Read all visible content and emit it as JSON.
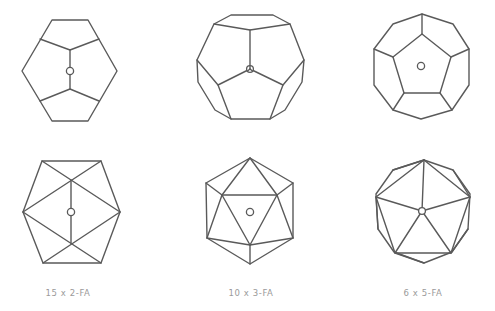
{
  "figure": {
    "line_color": "#5a5a5a",
    "caption_color": "#9a9a9a",
    "panels": [
      {
        "id": "dodecahedron-2fold",
        "solid": "dodecahedron",
        "view": "2-fold axis",
        "caption": ""
      },
      {
        "id": "dodecahedron-3fold",
        "solid": "dodecahedron",
        "view": "3-fold axis",
        "caption": ""
      },
      {
        "id": "dodecahedron-5fold",
        "solid": "dodecahedron",
        "view": "5-fold axis",
        "caption": ""
      },
      {
        "id": "icosahedron-2fold",
        "solid": "icosahedron",
        "view": "2-fold axis",
        "caption": "15 x 2-FA"
      },
      {
        "id": "icosahedron-3fold",
        "solid": "icosahedron",
        "view": "3-fold axis",
        "caption": "10 x 3-FA"
      },
      {
        "id": "icosahedron-5fold",
        "solid": "icosahedron",
        "view": "5-fold axis",
        "caption": "6 x 5-FA"
      }
    ]
  }
}
